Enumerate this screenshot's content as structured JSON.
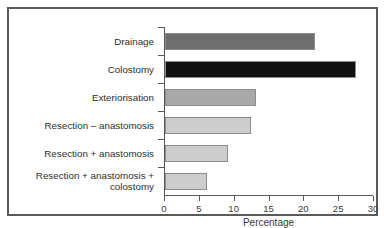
{
  "chart_data": {
    "type": "bar",
    "orientation": "horizontal",
    "title": "",
    "xlabel": "Percentage",
    "ylabel": "",
    "xlim": [
      0,
      30
    ],
    "xticks": [
      0,
      5,
      10,
      15,
      20,
      25,
      30
    ],
    "xticklabels": [
      "0",
      "5",
      "10",
      "15",
      "20",
      "25",
      "30"
    ],
    "grid": false,
    "legend": null,
    "categories": [
      "Drainage",
      "Colostomy",
      "Exteriorisation",
      "Resection – anastomosis",
      "Resection + anastomosis",
      "Resection + anastomosis +\ncolostomy"
    ],
    "values": [
      21.6,
      27.4,
      13.1,
      12.4,
      9.0,
      6.1
    ],
    "bar_colors": [
      "#6e6e6e",
      "#111111",
      "#a9a9a9",
      "#cdcdcd",
      "#cdcdcd",
      "#cdcdcd"
    ],
    "bar_edge_color": "#8d8d8d"
  },
  "figure": {
    "frame_color": "#5a5a5a",
    "background": "#ffffff",
    "axis_color": "#585858"
  }
}
